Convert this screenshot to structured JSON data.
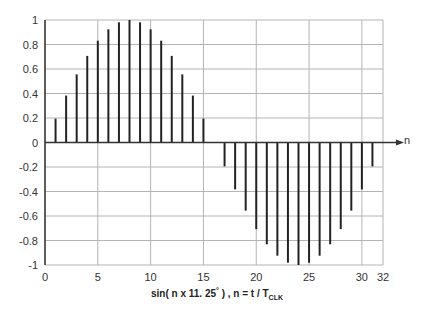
{
  "chart_data": {
    "type": "stem",
    "title": "",
    "xlabel": "sin( n x 11. 25 ° ) , n = t / T_CLK",
    "caption": {
      "prefix": "sin( n x 11. 25",
      "degree": "°",
      "middle": " ) ,  n = t / T",
      "subscript": "CLK"
    },
    "axis_arrow_label": "n",
    "xlim": [
      0,
      32
    ],
    "ylim": [
      -1,
      1
    ],
    "x_ticks": [
      0,
      5,
      10,
      15,
      20,
      25,
      30,
      32
    ],
    "y_ticks": [
      1,
      0.8,
      0.6,
      0.4,
      0.2,
      0,
      -0.2,
      -0.4,
      -0.6,
      -0.8,
      -1
    ],
    "y_tick_labels": [
      "1",
      "0.8",
      "0.6",
      "0.4",
      "0.2",
      "0",
      "-0.2",
      "-0.4",
      "-0.6",
      "-0.8",
      "-1"
    ],
    "grid": true,
    "x": [
      0,
      1,
      2,
      3,
      4,
      5,
      6,
      7,
      8,
      9,
      10,
      11,
      12,
      13,
      14,
      15,
      16,
      17,
      18,
      19,
      20,
      21,
      22,
      23,
      24,
      25,
      26,
      27,
      28,
      29,
      30,
      31
    ],
    "values": [
      0,
      0.195,
      0.383,
      0.556,
      0.707,
      0.831,
      0.924,
      0.981,
      1,
      0.981,
      0.924,
      0.831,
      0.707,
      0.556,
      0.383,
      0.195,
      0,
      -0.195,
      -0.383,
      -0.556,
      -0.707,
      -0.831,
      -0.924,
      -0.981,
      -1,
      -0.981,
      -0.924,
      -0.831,
      -0.707,
      -0.556,
      -0.383,
      -0.195
    ],
    "colors": {
      "stem": "#222222",
      "grid": "#b4b4b4",
      "axis": "#333333"
    }
  }
}
